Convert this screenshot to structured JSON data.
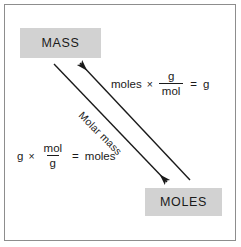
{
  "figure": {
    "background_color": "#ffffff",
    "frame_color": "#8d8d8d",
    "box_fill_color": "#d2d2d2",
    "text_color": "#1a1a1a",
    "arrow_color": "#1a1a1a"
  },
  "nodes": {
    "mass": {
      "label": "MASS"
    },
    "moles": {
      "label": "MOLES"
    }
  },
  "arrows": {
    "to_mass": {
      "direction": "up-left",
      "from": "MOLES",
      "to": "MASS",
      "arrowhead": "arrowhead-up-left"
    },
    "to_moles": {
      "direction": "down-right",
      "from": "MASS",
      "to": "MOLES",
      "arrowhead": "arrowhead-down-right"
    },
    "label": "Molar mass"
  },
  "equations": {
    "moles_to_grams": {
      "term1": "moles",
      "operator": "×",
      "fraction_numerator": "g",
      "fraction_denominator": "mol",
      "equals": "=",
      "result": "g"
    },
    "grams_to_moles": {
      "term1": "g",
      "operator": "×",
      "fraction_numerator": "mol",
      "fraction_denominator": "g",
      "equals": "=",
      "result": "moles"
    }
  }
}
